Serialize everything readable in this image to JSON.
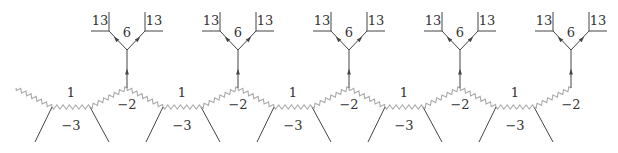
{
  "diagram": {
    "units": 5,
    "period": 111,
    "colors": {
      "line": "#444444",
      "wavy": "#aaaaaa",
      "text": "#333333"
    },
    "labels": {
      "curve_top": "1",
      "curve_bottom": "-3",
      "curve_mid": "−2",
      "bottom": "−3",
      "branch": "13",
      "center": "6"
    },
    "nodes": [
      {
        "top": "1",
        "bottom": "−3",
        "mid": "−2",
        "branches": [
          "13",
          "13"
        ],
        "center": "6"
      },
      {
        "top": "1",
        "bottom": "−3",
        "mid": "−2",
        "branches": [
          "13",
          "13"
        ],
        "center": "6"
      },
      {
        "top": "1",
        "bottom": "−3",
        "mid": "−2",
        "branches": [
          "13",
          "13"
        ],
        "center": "6"
      },
      {
        "top": "1",
        "bottom": "−3",
        "mid": "−2",
        "branches": [
          "13",
          "13"
        ],
        "center": "6"
      },
      {
        "top": "1",
        "bottom": "−3",
        "mid": "−2",
        "branches": [
          "13",
          "13"
        ],
        "center": "6"
      }
    ]
  }
}
